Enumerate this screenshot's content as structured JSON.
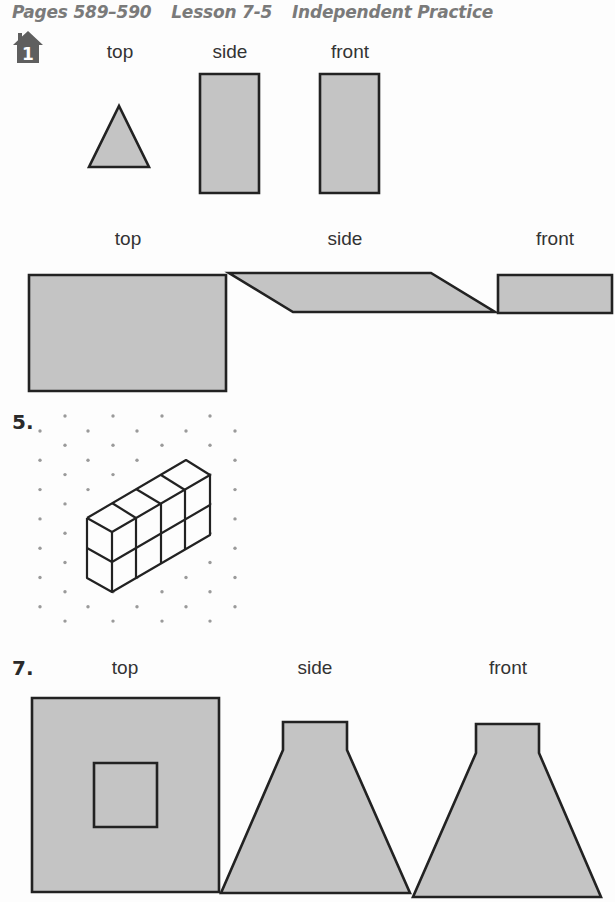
{
  "header": {
    "pages": "Pages 589–590",
    "lesson": "Lesson 7-5",
    "title": "Independent Practice"
  },
  "colors": {
    "fill": "#c4c4c4",
    "stroke": "#222222",
    "dot": "#9a9a9a",
    "icon": "#5f5f5f",
    "header_text": "#7a7a7a"
  },
  "icons": {
    "home_problem": "house-icon",
    "home_problem_number": "1"
  },
  "problem1": {
    "labels": [
      {
        "text": "top",
        "x": 120,
        "y": 42
      },
      {
        "text": "side",
        "x": 230,
        "y": 42
      },
      {
        "text": "front",
        "x": 350,
        "y": 42
      }
    ],
    "shapes": [
      {
        "name": "top-view-triangle",
        "points": "89,167 149,167 119,106"
      },
      {
        "name": "side-view-rectangle",
        "points": "200,74 259,74 259,193 200,193"
      },
      {
        "name": "front-view-rectangle",
        "points": "320,74 379,74 379,193 320,193"
      }
    ]
  },
  "problem3": {
    "labels": [
      {
        "text": "top",
        "x": 128,
        "y": 229
      },
      {
        "text": "side",
        "x": 345,
        "y": 229
      },
      {
        "text": "front",
        "x": 555,
        "y": 229
      }
    ],
    "shapes": [
      {
        "name": "top-view-rectangle",
        "points": "29,275 226,275 226,391 29,391"
      },
      {
        "name": "side-view-parallelogram",
        "points": "229,273 431,273 495,312 293,312"
      },
      {
        "name": "front-view-rectangle",
        "points": "498,275 612,275 612,313 498,313"
      }
    ]
  },
  "problem5": {
    "number": "5.",
    "dot_grid": {
      "odd_columns_x": [
        40,
        88,
        137,
        186,
        235
      ],
      "odd_start_y": 431,
      "even_columns_x": [
        65,
        113,
        162,
        210
      ],
      "even_start_y": 416,
      "row_step": 29.3,
      "odd_count": 7,
      "even_count": 8
    },
    "solid": {
      "silhouette": "87,518 186,460 210,475 210,535 112,592 87,578",
      "lines": [
        "87,518 186,460 210,475 112,532 87,518",
        "87,518 87,578 112,592 210,535 210,475",
        "112,532 112,592",
        "87,548 112,562 210,505",
        "136,518 136,578",
        "161,504 161,563",
        "185,490 185,549",
        "112,503 136,518",
        "136,489 161,504",
        "161,475 185,490",
        "136,518 136,518"
      ]
    }
  },
  "problem7": {
    "number": "7.",
    "labels": [
      {
        "text": "top",
        "x": 125,
        "y": 658
      },
      {
        "text": "side",
        "x": 315,
        "y": 658
      },
      {
        "text": "front",
        "x": 508,
        "y": 658
      }
    ],
    "shapes": [
      {
        "name": "top-view-outer-square",
        "points": "32,698 219,698 219,892 32,892"
      },
      {
        "name": "top-view-inner-square",
        "points": "94,763 157,763 157,827 94,827"
      },
      {
        "name": "side-view-trapezoid",
        "points": "283,722 347,722 347,750 410,893 221,893 283,750"
      },
      {
        "name": "front-view-trapezoid",
        "points": "476,724 539,724 539,753 601,897 413,897 476,753"
      }
    ]
  }
}
